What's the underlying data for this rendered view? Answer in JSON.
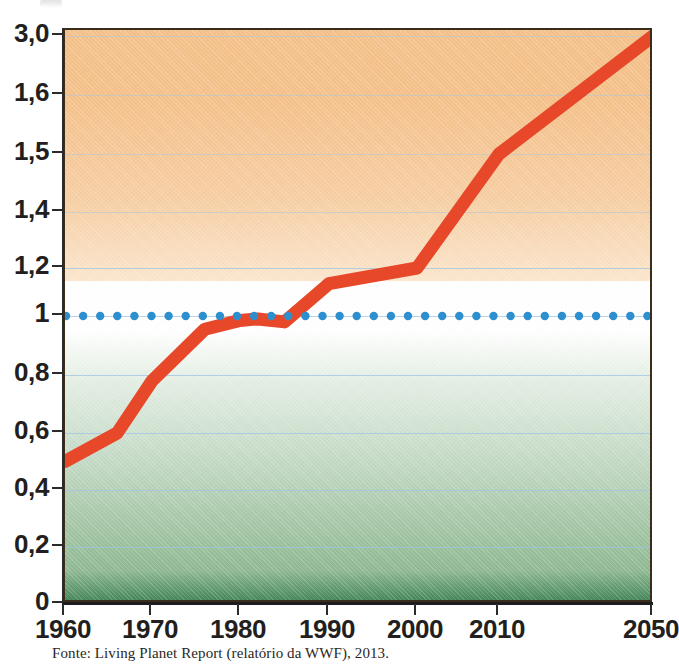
{
  "caption": "Fonte: Living Planet Report (relatório da WWF), 2013.",
  "colors": {
    "line": "#e8482a",
    "dotted_reference": "#2e8fce",
    "frame": "#3a2d1c",
    "gradient_top": "#f5c18a",
    "gradient_mid": "#ffffff",
    "gradient_bottom": "#46875a",
    "gridline": "#9dc4e4",
    "axis": "#2b2b2b",
    "text": "#231f20"
  },
  "chart_data": {
    "type": "line",
    "title": "",
    "subtitle": "",
    "xlabel": "",
    "ylabel": "",
    "grid": true,
    "legend": "none",
    "y_axis": {
      "tick_labels": [
        "0",
        "0,2",
        "0,4",
        "0,6",
        "0,8",
        "1",
        "1,2",
        "1,4",
        "1,5",
        "1,6",
        "3,0"
      ],
      "tick_values": [
        0,
        0.2,
        0.4,
        0.6,
        0.8,
        1,
        1.2,
        1.4,
        1.5,
        1.6,
        3.0
      ],
      "scale": "nonlinear-evenly-spaced",
      "ylim": [
        0,
        3.0
      ]
    },
    "x_axis": {
      "tick_labels": [
        "1960",
        "1970",
        "1980",
        "1990",
        "2000",
        "2010",
        "2050"
      ],
      "tick_values": [
        1960,
        1970,
        1980,
        1990,
        2000,
        2010,
        2050
      ],
      "scale": "nonlinear-compressed-at-end",
      "xlim": [
        1960,
        2050
      ]
    },
    "series": [
      {
        "name": "Pegada ecológica",
        "style": "solid-thick",
        "color": "#e8482a",
        "points": [
          {
            "x": 1960,
            "y": 0.5
          },
          {
            "x": 1966,
            "y": 0.6
          },
          {
            "x": 1970,
            "y": 0.78
          },
          {
            "x": 1976,
            "y": 0.955
          },
          {
            "x": 1980,
            "y": 0.985
          },
          {
            "x": 1982,
            "y": 0.99
          },
          {
            "x": 1985,
            "y": 0.98
          },
          {
            "x": 1990,
            "y": 1.135
          },
          {
            "x": 2000,
            "y": 1.2
          },
          {
            "x": 2010,
            "y": 1.5
          },
          {
            "x": 2050,
            "y": 3.05
          }
        ]
      },
      {
        "name": "Biocapacidade da Terra",
        "style": "dotted",
        "color": "#2e8fce",
        "constant_value": 1,
        "points": [
          {
            "x": 1960,
            "y": 1
          },
          {
            "x": 2050,
            "y": 1
          }
        ]
      }
    ]
  }
}
